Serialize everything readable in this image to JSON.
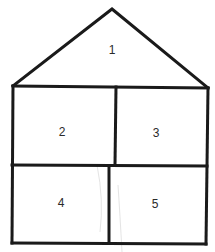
{
  "diagram": {
    "stroke_color": "#1a1a1a",
    "background": "#ffffff",
    "regions": [
      {
        "id": "roof",
        "label": "1"
      },
      {
        "id": "upper-left-room",
        "label": "2"
      },
      {
        "id": "upper-right-room",
        "label": "3"
      },
      {
        "id": "lower-left-room",
        "label": "4"
      },
      {
        "id": "lower-right-room",
        "label": "5"
      }
    ]
  }
}
